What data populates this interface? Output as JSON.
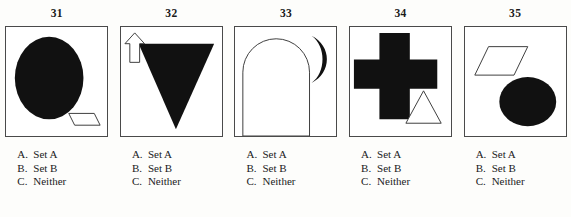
{
  "page": {
    "background_color": "#fdfdfb",
    "box_border_color": "#4a4a4a",
    "ink_color": "#111111"
  },
  "items": [
    {
      "number": "31",
      "figure_name": "figure-31-ellipse-and-parallelogram",
      "shapes": [
        {
          "name": "large-black-ellipse",
          "fill": "#111111"
        },
        {
          "name": "small-white-parallelogram",
          "fill": "#ffffff"
        }
      ],
      "options": [
        {
          "letter": "A.",
          "text": "Set A"
        },
        {
          "letter": "B.",
          "text": "Set B"
        },
        {
          "letter": "C.",
          "text": "Neither"
        }
      ]
    },
    {
      "number": "32",
      "figure_name": "figure-32-triangle-and-arrow",
      "shapes": [
        {
          "name": "large-black-down-triangle",
          "fill": "#111111"
        },
        {
          "name": "small-white-up-arrow",
          "fill": "#ffffff"
        }
      ],
      "options": [
        {
          "letter": "A.",
          "text": "Set A"
        },
        {
          "letter": "B.",
          "text": "Set B"
        },
        {
          "letter": "C.",
          "text": "Neither"
        }
      ]
    },
    {
      "number": "33",
      "figure_name": "figure-33-arch-and-crescent",
      "shapes": [
        {
          "name": "large-white-arch",
          "fill": "#ffffff"
        },
        {
          "name": "small-black-crescent-moon",
          "fill": "#111111"
        }
      ],
      "options": [
        {
          "letter": "A.",
          "text": "Set A"
        },
        {
          "letter": "B.",
          "text": "Set B"
        },
        {
          "letter": "C.",
          "text": "Neither"
        }
      ]
    },
    {
      "number": "34",
      "figure_name": "figure-34-cross-and-triangle",
      "shapes": [
        {
          "name": "large-black-cross",
          "fill": "#111111"
        },
        {
          "name": "small-white-triangle",
          "fill": "#ffffff"
        }
      ],
      "options": [
        {
          "letter": "A.",
          "text": "Set A"
        },
        {
          "letter": "B.",
          "text": "Set B"
        },
        {
          "letter": "C.",
          "text": "Neither"
        }
      ]
    },
    {
      "number": "35",
      "figure_name": "figure-35-parallelogram-and-circle",
      "shapes": [
        {
          "name": "small-white-parallelogram",
          "fill": "#ffffff"
        },
        {
          "name": "large-black-ellipse",
          "fill": "#111111"
        }
      ],
      "options": [
        {
          "letter": "A.",
          "text": "Set A"
        },
        {
          "letter": "B.",
          "text": "Set B"
        },
        {
          "letter": "C.",
          "text": "Neither"
        }
      ]
    }
  ]
}
